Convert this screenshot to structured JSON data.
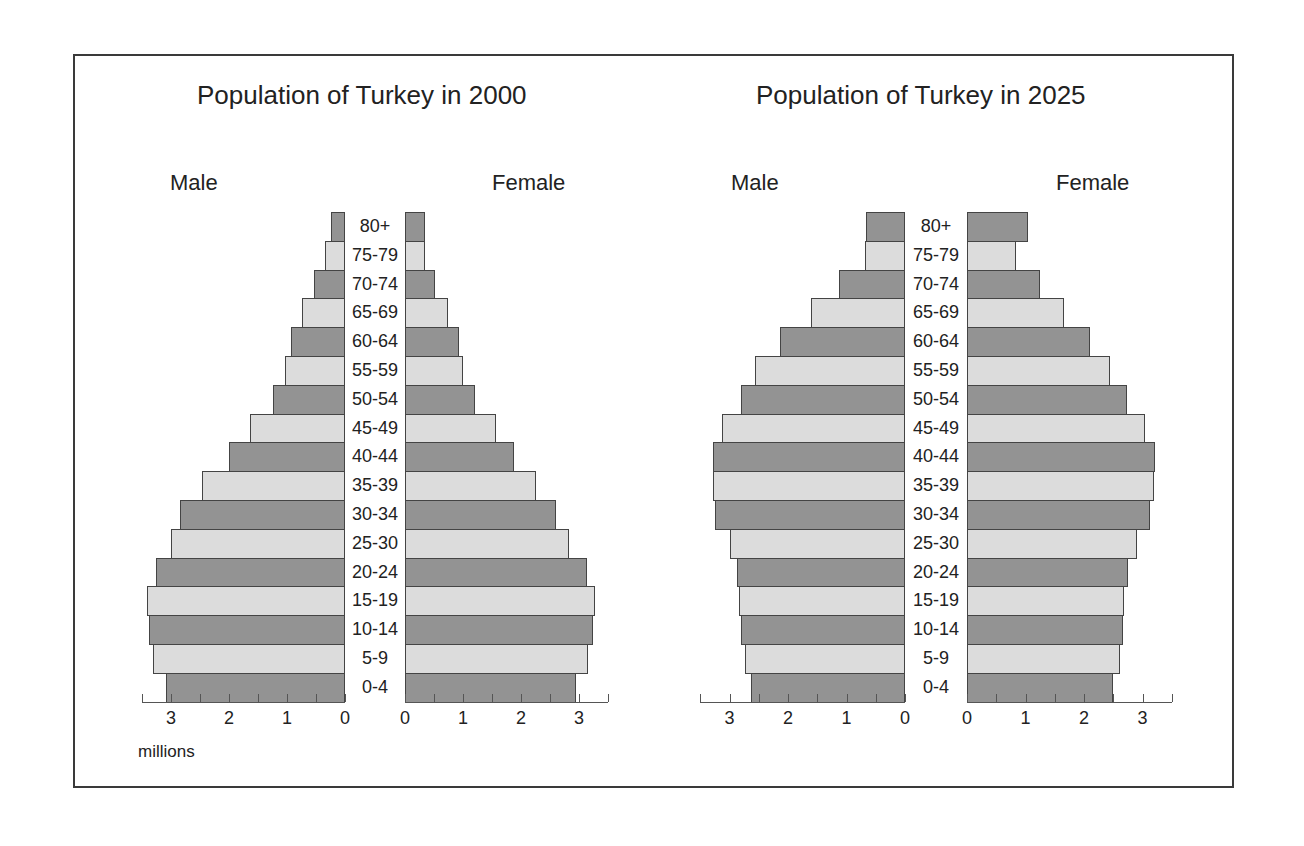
{
  "chart_data": [
    {
      "type": "bar",
      "orientation": "horizontal-population-pyramid",
      "title": "Population of Turkey in 2000",
      "xlabel": "millions",
      "categories": [
        "80+",
        "75-79",
        "70-74",
        "65-69",
        "60-64",
        "55-59",
        "50-54",
        "45-49",
        "40-44",
        "35-39",
        "30-34",
        "25-30",
        "20-24",
        "15-19",
        "10-14",
        "5-9",
        "0-4"
      ],
      "series": [
        {
          "name": "Male",
          "values": [
            0.24,
            0.34,
            0.53,
            0.74,
            0.93,
            1.03,
            1.24,
            1.64,
            2.0,
            2.47,
            2.84,
            3.0,
            3.26,
            3.41,
            3.38,
            3.31,
            3.09
          ]
        },
        {
          "name": "Female",
          "values": [
            0.34,
            0.34,
            0.52,
            0.74,
            0.93,
            1.0,
            1.21,
            1.57,
            1.88,
            2.26,
            2.6,
            2.83,
            3.14,
            3.28,
            3.24,
            3.16,
            2.95
          ]
        }
      ],
      "xlim": [
        0,
        3.5
      ],
      "xticks": [
        "3",
        "2",
        "1",
        "0"
      ],
      "xticks_female": [
        "0",
        "1",
        "2",
        "3"
      ],
      "grid": false
    },
    {
      "type": "bar",
      "orientation": "horizontal-population-pyramid",
      "title": "Population of Turkey in 2025",
      "xlabel": "",
      "categories": [
        "80+",
        "75-79",
        "70-74",
        "65-69",
        "60-64",
        "55-59",
        "50-54",
        "45-49",
        "40-44",
        "35-39",
        "30-34",
        "25-30",
        "20-24",
        "15-19",
        "10-14",
        "5-9",
        "0-4"
      ],
      "series": [
        {
          "name": "Male",
          "values": [
            0.67,
            0.69,
            1.13,
            1.61,
            2.14,
            2.57,
            2.81,
            3.12,
            3.29,
            3.29,
            3.24,
            3.0,
            2.88,
            2.83,
            2.8,
            2.73,
            2.64
          ]
        },
        {
          "name": "Female",
          "values": [
            1.04,
            0.83,
            1.24,
            1.65,
            2.1,
            2.45,
            2.73,
            3.05,
            3.22,
            3.19,
            3.13,
            2.91,
            2.76,
            2.69,
            2.66,
            2.61,
            2.5
          ]
        }
      ],
      "xlim": [
        0,
        3.5
      ],
      "xticks": [
        "3",
        "2",
        "1",
        "0"
      ],
      "xticks_female": [
        "0",
        "1",
        "2",
        "3"
      ],
      "grid": false
    }
  ],
  "labels": {
    "male": "Male",
    "female": "Female",
    "unit": "millions"
  },
  "colors": {
    "bar_dark": "#939393",
    "bar_light": "#dcdcdc",
    "bar_border": "#444444",
    "frame": "#3a3a3a"
  }
}
